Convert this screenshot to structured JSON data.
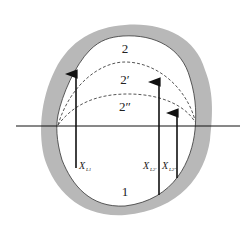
{
  "diagram": {
    "colors": {
      "wall": "#b8b8b8",
      "outline": "#333333",
      "line": "#111111",
      "background": "#ffffff"
    },
    "regions": [
      {
        "id": "region-2",
        "label": "2"
      },
      {
        "id": "region-2-prime",
        "label": "2′"
      },
      {
        "id": "region-2-double-prime",
        "label": "2″"
      },
      {
        "id": "region-1",
        "label": "1"
      }
    ],
    "vectors": [
      {
        "id": "x-l1",
        "label": "X",
        "subscript": "L1"
      },
      {
        "id": "x-l2prime",
        "label": "X",
        "subscript": "L2′"
      },
      {
        "id": "x-l2doubleprime",
        "label": "X",
        "subscript": "L2″"
      }
    ]
  }
}
